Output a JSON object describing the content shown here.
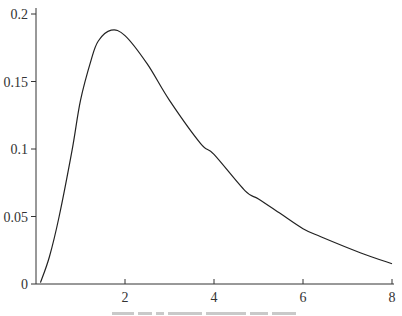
{
  "chart_data": {
    "type": "line",
    "title": "",
    "xlabel": "",
    "ylabel": "",
    "xlim": [
      0,
      8
    ],
    "ylim": [
      0,
      0.2
    ],
    "grid": false,
    "legend": null,
    "x_ticks": [
      {
        "value": 2,
        "label": "2"
      },
      {
        "value": 4,
        "label": "4"
      },
      {
        "value": 6,
        "label": "6"
      },
      {
        "value": 8,
        "label": "8"
      }
    ],
    "y_ticks": [
      {
        "value": 0,
        "label": "0"
      },
      {
        "value": 0.05,
        "label": "0.05"
      },
      {
        "value": 0.1,
        "label": "0.1"
      },
      {
        "value": 0.15,
        "label": "0.15"
      },
      {
        "value": 0.2,
        "label": "0.2"
      }
    ],
    "series": [
      {
        "name": "density",
        "x": [
          0.1,
          0.3,
          0.52,
          0.81,
          1.0,
          1.24,
          1.4,
          1.69,
          2.0,
          2.5,
          3.0,
          3.7,
          4.0,
          4.7,
          5.0,
          5.5,
          6.0,
          6.4,
          7.3,
          8.0
        ],
        "y": [
          0.001,
          0.02,
          0.05,
          0.099,
          0.136,
          0.166,
          0.18,
          0.188,
          0.184,
          0.163,
          0.136,
          0.104,
          0.096,
          0.069,
          0.063,
          0.052,
          0.041,
          0.035,
          0.023,
          0.015
        ]
      }
    ],
    "caption": "(caption cut off at bottom edge — illegible)"
  }
}
